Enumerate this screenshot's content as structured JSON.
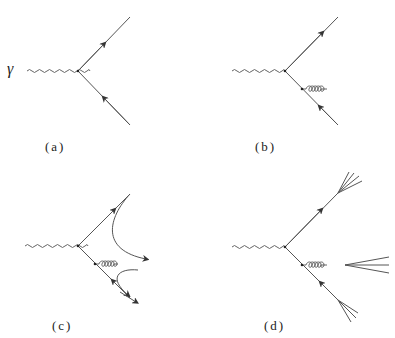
{
  "figure": {
    "photon_label": "γ",
    "panels": [
      {
        "id": "a",
        "label": "(a)",
        "description": "photon to quark-antiquark pair"
      },
      {
        "id": "b",
        "label": "(b)",
        "description": "photon to quark-antiquark with gluon emission"
      },
      {
        "id": "c",
        "label": "(c)",
        "description": "colour flow string connections"
      },
      {
        "id": "d",
        "label": "(d)",
        "description": "three-jet hadronization"
      }
    ]
  },
  "colors": {
    "line": "#555555",
    "text": "#222222",
    "background": "#ffffff"
  }
}
